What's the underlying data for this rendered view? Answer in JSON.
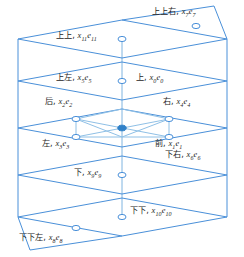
{
  "figure": {
    "type": "3d-lattice-direction-diagram",
    "colors": {
      "line": "#4a90d9",
      "center_dot_fill": "#2f80c8",
      "marker_stroke": "#4a90d9",
      "marker_fill": "#ffffff",
      "text": "#262626",
      "background": "#ffffff"
    },
    "labels": [
      {
        "id": "up-up-right",
        "cn": "上上右",
        "sym": "x",
        "sub": "7",
        "e": "e",
        "esub": "7",
        "x": 152,
        "y": 7
      },
      {
        "id": "up-up",
        "cn": "上上",
        "sym": "x",
        "sub": "11",
        "e": "e",
        "esub": "11",
        "x": 56,
        "y": 31
      },
      {
        "id": "up-left",
        "cn": "上左",
        "sym": "x",
        "sub": "5",
        "e": "e",
        "esub": "5",
        "x": 56,
        "y": 73
      },
      {
        "id": "up",
        "cn": "上",
        "sym": "x",
        "sub": "0",
        "e": "e",
        "esub": "0",
        "x": 136,
        "y": 73
      },
      {
        "id": "back",
        "cn": "后",
        "sym": "x",
        "sub": "2",
        "e": "e",
        "esub": "2",
        "x": 45,
        "y": 97
      },
      {
        "id": "right",
        "cn": "右",
        "sym": "x",
        "sub": "4",
        "e": "e",
        "esub": "4",
        "x": 163,
        "y": 97
      },
      {
        "id": "left",
        "cn": "左",
        "sym": "x",
        "sub": "3",
        "e": "e",
        "esub": "3",
        "x": 42,
        "y": 139
      },
      {
        "id": "front",
        "cn": "前",
        "sym": "x",
        "sub": "1",
        "e": "e",
        "esub": "1",
        "x": 155,
        "y": 139
      },
      {
        "id": "down-right",
        "cn": "下右",
        "sym": "x",
        "sub": "6",
        "e": "e",
        "esub": "6",
        "x": 165,
        "y": 150
      },
      {
        "id": "down",
        "cn": "下",
        "sym": "x",
        "sub": "9",
        "e": "e",
        "esub": "9",
        "x": 74,
        "y": 168
      },
      {
        "id": "down-down",
        "cn": "下下",
        "sym": "x",
        "sub": "10",
        "e": "e",
        "esub": "10",
        "x": 130,
        "y": 206
      },
      {
        "id": "down-down-left",
        "cn": "下下左",
        "sym": "x",
        "sub": "8",
        "e": "e",
        "esub": "8",
        "x": 19,
        "y": 233
      }
    ],
    "rhombi": [
      {
        "id": "rhombus-level-1-up-up",
        "cy": 39
      },
      {
        "id": "rhombus-level-2-up",
        "cy": 81
      },
      {
        "id": "rhombus-level-3-center",
        "cy": 128
      },
      {
        "id": "rhombus-level-4-down",
        "cy": 175
      },
      {
        "id": "rhombus-level-5-down-down",
        "cy": 217
      }
    ],
    "markers": [
      {
        "id": "node-up-up-right",
        "cx": 196,
        "cy": 26
      },
      {
        "id": "node-up-up",
        "cx": 122,
        "cy": 39
      },
      {
        "id": "node-up",
        "cx": 122,
        "cy": 81
      },
      {
        "id": "node-back",
        "cx": 76,
        "cy": 119
      },
      {
        "id": "node-right",
        "cx": 169,
        "cy": 119
      },
      {
        "id": "node-center",
        "cx": 122,
        "cy": 128,
        "filled": true
      },
      {
        "id": "node-left",
        "cx": 76,
        "cy": 137
      },
      {
        "id": "node-front",
        "cx": 169,
        "cy": 137
      },
      {
        "id": "node-down",
        "cx": 122,
        "cy": 175
      },
      {
        "id": "node-down-down",
        "cx": 122,
        "cy": 217
      },
      {
        "id": "node-down-down-left",
        "cx": 76,
        "cy": 228
      }
    ]
  }
}
